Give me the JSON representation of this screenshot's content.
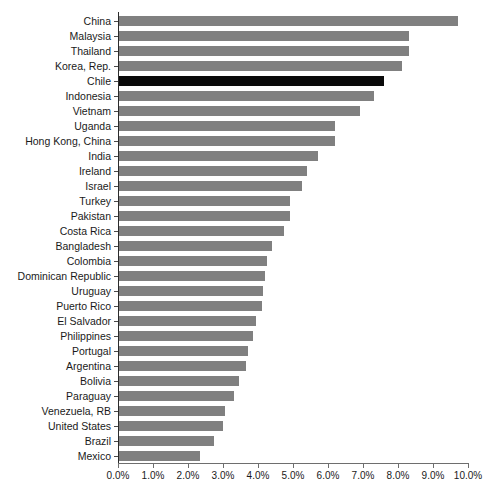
{
  "chart_data": {
    "type": "bar",
    "orientation": "horizontal",
    "title": "",
    "subtitle": "",
    "xlabel": "",
    "ylabel": "",
    "xlim": [
      0,
      10
    ],
    "xtick_labels": [
      "0.0%",
      "1.0%",
      "2.0%",
      "3.0%",
      "4.0%",
      "5.0%",
      "6.0%",
      "7.0%",
      "8.0%",
      "9.0%",
      "10.0%"
    ],
    "xtick_values": [
      0,
      1,
      2,
      3,
      4,
      5,
      6,
      7,
      8,
      9,
      10
    ],
    "grid": false,
    "legend": "none",
    "value_unit": "%",
    "series_name": "",
    "bar_color": "#808080",
    "highlight_color": "#0a0a0a",
    "highlight_category": "Chile",
    "categories": [
      "China",
      "Malaysia",
      "Thailand",
      "Korea, Rep.",
      "Chile",
      "Indonesia",
      "Vietnam",
      "Uganda",
      "Hong Kong, China",
      "India",
      "Ireland",
      "Israel",
      "Turkey",
      "Pakistan",
      "Costa Rica",
      "Bangladesh",
      "Colombia",
      "Dominican Republic",
      "Uruguay",
      "Puerto Rico",
      "El Salvador",
      "Philippines",
      "Portugal",
      "Argentina",
      "Bolivia",
      "Paraguay",
      "Venezuela, RB",
      "United States",
      "Brazil",
      "Mexico"
    ],
    "values": [
      9.7,
      8.3,
      8.3,
      8.1,
      7.6,
      7.3,
      6.9,
      6.2,
      6.2,
      5.7,
      5.4,
      5.25,
      4.9,
      4.9,
      4.75,
      4.4,
      4.25,
      4.2,
      4.15,
      4.1,
      3.95,
      3.85,
      3.7,
      3.65,
      3.45,
      3.3,
      3.05,
      3.0,
      2.75,
      2.35
    ],
    "bars": [
      {
        "label": "China",
        "value": 9.7,
        "highlight": false
      },
      {
        "label": "Malaysia",
        "value": 8.3,
        "highlight": false
      },
      {
        "label": "Thailand",
        "value": 8.3,
        "highlight": false
      },
      {
        "label": "Korea, Rep.",
        "value": 8.1,
        "highlight": false
      },
      {
        "label": "Chile",
        "value": 7.6,
        "highlight": true
      },
      {
        "label": "Indonesia",
        "value": 7.3,
        "highlight": false
      },
      {
        "label": "Vietnam",
        "value": 6.9,
        "highlight": false
      },
      {
        "label": "Uganda",
        "value": 6.2,
        "highlight": false
      },
      {
        "label": "Hong Kong, China",
        "value": 6.2,
        "highlight": false
      },
      {
        "label": "India",
        "value": 5.7,
        "highlight": false
      },
      {
        "label": "Ireland",
        "value": 5.4,
        "highlight": false
      },
      {
        "label": "Israel",
        "value": 5.25,
        "highlight": false
      },
      {
        "label": "Turkey",
        "value": 4.9,
        "highlight": false
      },
      {
        "label": "Pakistan",
        "value": 4.9,
        "highlight": false
      },
      {
        "label": "Costa Rica",
        "value": 4.75,
        "highlight": false
      },
      {
        "label": "Bangladesh",
        "value": 4.4,
        "highlight": false
      },
      {
        "label": "Colombia",
        "value": 4.25,
        "highlight": false
      },
      {
        "label": "Dominican Republic",
        "value": 4.2,
        "highlight": false
      },
      {
        "label": "Uruguay",
        "value": 4.15,
        "highlight": false
      },
      {
        "label": "Puerto Rico",
        "value": 4.1,
        "highlight": false
      },
      {
        "label": "El Salvador",
        "value": 3.95,
        "highlight": false
      },
      {
        "label": "Philippines",
        "value": 3.85,
        "highlight": false
      },
      {
        "label": "Portugal",
        "value": 3.7,
        "highlight": false
      },
      {
        "label": "Argentina",
        "value": 3.65,
        "highlight": false
      },
      {
        "label": "Bolivia",
        "value": 3.45,
        "highlight": false
      },
      {
        "label": "Paraguay",
        "value": 3.3,
        "highlight": false
      },
      {
        "label": "Venezuela, RB",
        "value": 3.05,
        "highlight": false
      },
      {
        "label": "United States",
        "value": 3.0,
        "highlight": false
      },
      {
        "label": "Brazil",
        "value": 2.75,
        "highlight": false
      },
      {
        "label": "Mexico",
        "value": 2.35,
        "highlight": false
      }
    ]
  }
}
